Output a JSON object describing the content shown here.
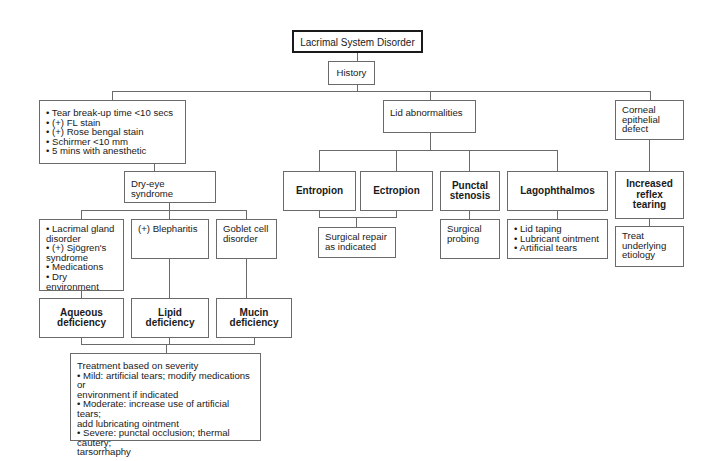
{
  "diagram": {
    "root": "Lacrimal System Disorder",
    "history": "History",
    "branches": {
      "dry_eye": {
        "findings": "• Tear break-up time <10 secs\n• (+) FL stain\n• (+) Rose bengal stain\n• Schirmer <10 mm\n• 5 mins with anesthetic",
        "syndrome": "Dry-eye syndrome",
        "causes": [
          {
            "cause": "• Lacrimal gland\ndisorder\n• (+) Sjögren's\nsyndrome\n• Medications\n• Dry environment",
            "deficiency": "Aqueous\ndeficiency"
          },
          {
            "cause": "(+) Blepharitis",
            "deficiency": "Lipid\ndeficiency"
          },
          {
            "cause": "Goblet cell\ndisorder",
            "deficiency": "Mucin\ndeficiency"
          }
        ],
        "treatment": "Treatment based on severity\n• Mild: artificial tears; modify medications or\nenvironment if indicated\n• Moderate: increase use of artificial tears;\nadd lubricating ointment\n• Severe: punctal occlusion; thermal cautery;\ntarsorrhaphy"
      },
      "lid": {
        "label": "Lid abnormalities",
        "conditions": [
          {
            "name": "Entropion"
          },
          {
            "name": "Ectropion"
          },
          {
            "name": "Punctal\nstenosis",
            "treatment": "Surgical\nprobing"
          },
          {
            "name": "Lagophthalmos",
            "treatment": "• Lid taping\n• Lubricant ointment\n• Artificial tears"
          }
        ],
        "entropion_ectropion_treatment": "Surgical repair\nas indicated"
      },
      "corneal": {
        "label": "Corneal\nepithelial\ndefect",
        "result": "Increased\nreflex tearing",
        "treatment": "Treat\nunderlying\netiology"
      }
    }
  }
}
